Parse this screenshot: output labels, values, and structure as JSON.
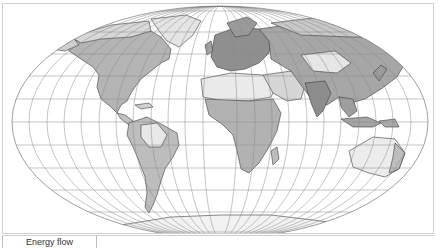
{
  "map": {
    "projection": "pseudo-cylindrical equal-area (Mollweide-like)",
    "style": "grayscale",
    "colors": {
      "background": "#ffffff",
      "ocean": "#ffffff",
      "graticule": "#8a8a8a",
      "coastline": "#333333",
      "land_low": "#dcdcdc",
      "land_mid": "#b8b8b8",
      "land_high": "#8e8e8e",
      "frame_border": "#cfcfcf"
    },
    "graticule": {
      "parallels_step_deg": 10,
      "meridians_step_deg": 15
    },
    "regions": [
      "North America",
      "South America",
      "Europe",
      "Africa",
      "Asia",
      "Australia",
      "Antarctica",
      "Greenland"
    ]
  },
  "legend": {
    "cells": [
      {
        "label": "Energy flow"
      },
      {
        "label": ""
      }
    ]
  }
}
